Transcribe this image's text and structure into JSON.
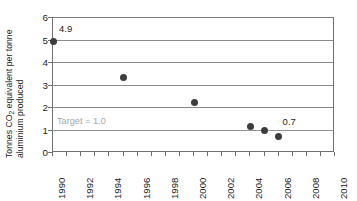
{
  "chart_data": {
    "type": "scatter",
    "title": "",
    "subtitle": "",
    "xlabel": "",
    "ylabel_line1": "Tonnes CO",
    "ylabel_sub": "2",
    "ylabel_line1b": " equivalent per tonne",
    "ylabel_line2": "aluminium produced",
    "ylabel_full": "Tonnes CO2 equivalent per tonne aluminium produced",
    "xlim": [
      1990,
      2010
    ],
    "ylim": [
      0,
      6
    ],
    "x_tick_labels": [
      "1990",
      "1992",
      "1994",
      "1996",
      "1998",
      "2000",
      "2002",
      "2004",
      "2006",
      "2008",
      "2010"
    ],
    "x_tick_values": [
      1990,
      1992,
      1994,
      1996,
      1998,
      2000,
      2002,
      2004,
      2006,
      2008,
      2010
    ],
    "x_minor_ticks": [
      1990,
      1991,
      1992,
      1993,
      1994,
      1995,
      1996,
      1997,
      1998,
      1999,
      2000,
      2001,
      2002,
      2003,
      2004,
      2005,
      2006,
      2007,
      2008,
      2009,
      2010
    ],
    "y_tick_labels": [
      "0",
      "1",
      "2",
      "3",
      "4",
      "5",
      "6"
    ],
    "y_tick_values": [
      0,
      1,
      2,
      3,
      4,
      5,
      6
    ],
    "grid": "horizontal",
    "gridlines": [
      1,
      2,
      3,
      4,
      5,
      6
    ],
    "legend": "none",
    "x": [
      1990,
      1995,
      2000,
      2004,
      2005,
      2006
    ],
    "values": [
      4.9,
      3.3,
      2.2,
      1.15,
      0.95,
      0.7
    ],
    "series": [
      {
        "name": "Greenhouse gas intensity",
        "x": [
          1990,
          1995,
          2000,
          2004,
          2005,
          2006
        ],
        "values": [
          4.9,
          3.3,
          2.2,
          1.15,
          0.95,
          0.7
        ]
      }
    ],
    "point_labels": [
      {
        "text": "4.9",
        "x": 1990,
        "y": 4.9
      },
      {
        "text": "0.7",
        "x": 2006,
        "y": 0.7
      }
    ],
    "reference_line": {
      "label": "Target = 1.0",
      "value": 1.0,
      "style": "dotted"
    },
    "colors": {
      "marker": "#3d3d3d",
      "gridline": "#8a8a8a",
      "axis": "#6f6f6f",
      "target_text": "#a6a6a6",
      "text": "#1e1e1e",
      "background": "#ffffff"
    }
  }
}
